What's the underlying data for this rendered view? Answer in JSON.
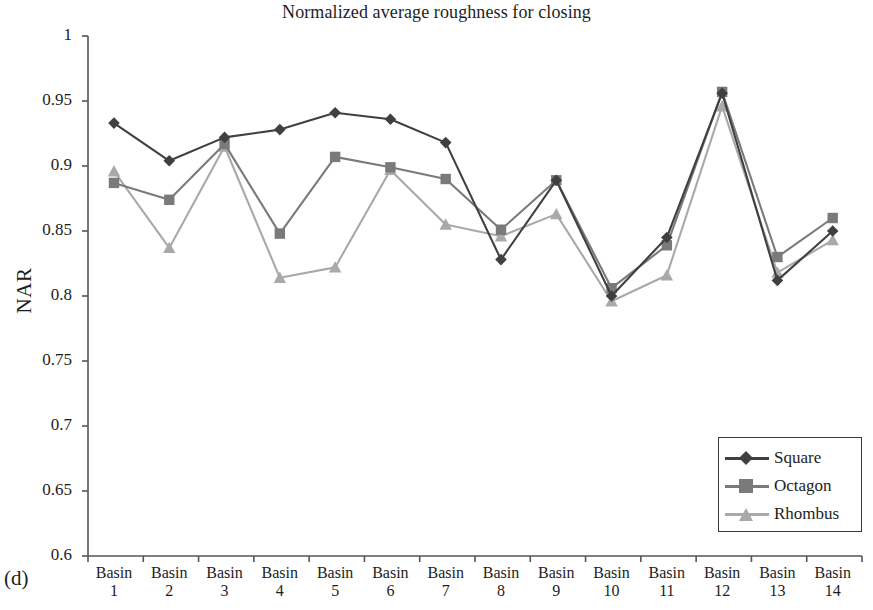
{
  "chart_data": {
    "type": "line",
    "title": "Normalized average roughness for closing",
    "panel_label": "(d)",
    "xlabel": "",
    "ylabel": "NAR",
    "ylim": [
      0.6,
      1.0
    ],
    "ytick_labels": [
      "1",
      "0.95",
      "0.9",
      "0.85",
      "0.8",
      "0.75",
      "0.7",
      "0.65",
      "0.6"
    ],
    "ytick_values": [
      1,
      0.95,
      0.9,
      0.85,
      0.8,
      0.75,
      0.7,
      0.65,
      0.6
    ],
    "grid": false,
    "legend_position": "bottom-right",
    "categories": [
      "Basin 1",
      "Basin 2",
      "Basin 3",
      "Basin 4",
      "Basin 5",
      "Basin 6",
      "Basin 7",
      "Basin 8",
      "Basin 9",
      "Basin 10",
      "Basin 11",
      "Basin 12",
      "Basin 13",
      "Basin 14"
    ],
    "category_lines": [
      [
        "Basin",
        "1"
      ],
      [
        "Basin",
        "2"
      ],
      [
        "Basin",
        "3"
      ],
      [
        "Basin",
        "4"
      ],
      [
        "Basin",
        "5"
      ],
      [
        "Basin",
        "6"
      ],
      [
        "Basin",
        "7"
      ],
      [
        "Basin",
        "8"
      ],
      [
        "Basin",
        "9"
      ],
      [
        "Basin",
        "10"
      ],
      [
        "Basin",
        "11"
      ],
      [
        "Basin",
        "12"
      ],
      [
        "Basin",
        "13"
      ],
      [
        "Basin",
        "14"
      ]
    ],
    "series": [
      {
        "name": "Square",
        "color": "#404040",
        "marker": "diamond",
        "values": [
          0.933,
          0.904,
          0.922,
          0.928,
          0.941,
          0.936,
          0.918,
          0.828,
          0.889,
          0.8,
          0.845,
          0.956,
          0.812,
          0.85
        ]
      },
      {
        "name": "Octagon",
        "color": "#7a7a7a",
        "marker": "square",
        "values": [
          0.887,
          0.874,
          0.917,
          0.848,
          0.907,
          0.899,
          0.89,
          0.851,
          0.889,
          0.806,
          0.839,
          0.957,
          0.83,
          0.86
        ]
      },
      {
        "name": "Rhombus",
        "color": "#a9a9a9",
        "marker": "triangle",
        "values": [
          0.896,
          0.837,
          0.915,
          0.814,
          0.822,
          0.897,
          0.855,
          0.846,
          0.863,
          0.796,
          0.816,
          0.946,
          0.818,
          0.843
        ]
      }
    ]
  },
  "legend": {
    "items": [
      {
        "label": "Square"
      },
      {
        "label": "Octagon"
      },
      {
        "label": "Rhombus"
      }
    ]
  }
}
